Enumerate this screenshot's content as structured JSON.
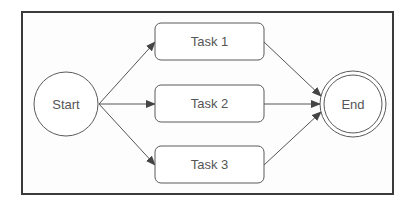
{
  "diagram": {
    "type": "flowchart",
    "colors": {
      "frame_stroke": "#3a3a3a",
      "node_stroke": "#5a5a5a",
      "edge_stroke": "#555555",
      "text": "#555555",
      "background": "#fdfdfd"
    },
    "nodes": {
      "start": {
        "label": "Start",
        "shape": "circle"
      },
      "task1": {
        "label": "Task 1",
        "shape": "rounded-rectangle"
      },
      "task2": {
        "label": "Task 2",
        "shape": "rounded-rectangle"
      },
      "task3": {
        "label": "Task 3",
        "shape": "rounded-rectangle"
      },
      "end": {
        "label": "End",
        "shape": "double-circle"
      }
    },
    "edges": [
      {
        "from": "Start",
        "to": "Task 1"
      },
      {
        "from": "Start",
        "to": "Task 2"
      },
      {
        "from": "Start",
        "to": "Task 3"
      },
      {
        "from": "Task 1",
        "to": "End"
      },
      {
        "from": "Task 2",
        "to": "End"
      },
      {
        "from": "Task 3",
        "to": "End"
      }
    ]
  }
}
